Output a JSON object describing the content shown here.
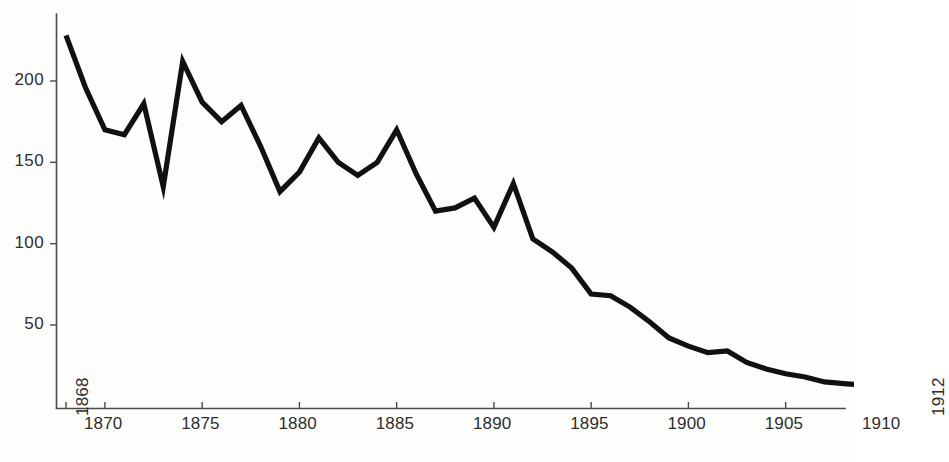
{
  "chart_data": {
    "type": "line",
    "title": "",
    "subtitle": "",
    "xlabel": "",
    "ylabel": "",
    "xlim": [
      1868,
      1912
    ],
    "ylim": [
      0,
      240
    ],
    "grid": false,
    "legend": null,
    "line_color": "#111111",
    "axis_color": "#4a4a4a",
    "y_ticks": [
      50,
      100,
      150,
      200
    ],
    "y_tick_labels": [
      "50",
      "100",
      "150",
      "200"
    ],
    "x_ticks": [
      1868,
      1870,
      1875,
      1880,
      1885,
      1890,
      1895,
      1900,
      1905,
      1910,
      1912
    ],
    "x_tick_labels": [
      "1868",
      "1870",
      "1875",
      "1880",
      "1885",
      "1890",
      "1895",
      "1900",
      "1905",
      "1910",
      "1912"
    ],
    "x_tick_rotated": [
      true,
      false,
      false,
      false,
      false,
      false,
      false,
      false,
      false,
      false,
      true
    ],
    "x": [
      1868,
      1869,
      1870,
      1871,
      1872,
      1873,
      1874,
      1875,
      1876,
      1877,
      1878,
      1879,
      1880,
      1881,
      1882,
      1883,
      1884,
      1885,
      1886,
      1887,
      1888,
      1889,
      1890,
      1891,
      1892,
      1893,
      1894,
      1895,
      1896,
      1897,
      1898,
      1899,
      1900,
      1901,
      1902,
      1903,
      1904,
      1905,
      1906,
      1907,
      1908,
      1909,
      1910,
      1911,
      1912
    ],
    "values": [
      228,
      196,
      170,
      167,
      186,
      135,
      212,
      187,
      175,
      185,
      160,
      132,
      144,
      165,
      150,
      142,
      150,
      170,
      143,
      120,
      122,
      128,
      110,
      137,
      103,
      95,
      85,
      69,
      68,
      61,
      52,
      42,
      37,
      33,
      34,
      27,
      23,
      20,
      18,
      15,
      14,
      13,
      12,
      12,
      12
    ],
    "footer_text": ""
  },
  "axes": {
    "y_axis_name": "value-axis",
    "x_axis_name": "year-axis"
  }
}
